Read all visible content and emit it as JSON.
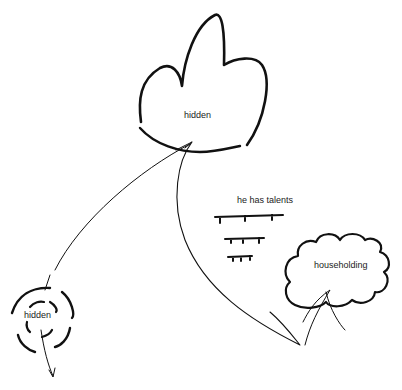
{
  "diagram": {
    "nodes": [
      {
        "id": "top-cloud",
        "label": "hidden",
        "shape": "cloud-three-lobes"
      },
      {
        "id": "bottom-left-dashed",
        "label": "hidden",
        "shape": "dashed-concentric-circles"
      },
      {
        "id": "right-cloud",
        "label": "householding",
        "shape": "cloud"
      }
    ],
    "annotation": {
      "text": "he has talents",
      "ruled_lines": 3
    },
    "edges": [
      {
        "from": "top-cloud",
        "to": "bottom-left-dashed",
        "style": "curve"
      },
      {
        "from": "top-cloud",
        "to": "right-cloud",
        "style": "curve"
      },
      {
        "from": "bottom-left-dashed",
        "to": "below",
        "style": "arrow"
      }
    ],
    "stroke_color": "#111111"
  }
}
